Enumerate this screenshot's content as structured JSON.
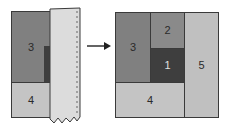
{
  "colors": {
    "block1": "#3e3e3e",
    "block2": "#8a8a8a",
    "block3": "#808080",
    "block4": "#c4c4c4",
    "block5": "#c0c0c0",
    "paper": "#dcdcdc",
    "stroke": "#3a3a3a"
  },
  "before": {
    "blocks": [
      {
        "id": "3",
        "label": "3"
      },
      {
        "id": "4",
        "label": "4"
      }
    ],
    "paper_strip": "perforated-paper-icon"
  },
  "arrow": "right-arrow-icon",
  "after": {
    "blocks": [
      {
        "id": "3",
        "label": "3"
      },
      {
        "id": "2",
        "label": "2"
      },
      {
        "id": "1",
        "label": "1"
      },
      {
        "id": "5",
        "label": "5"
      },
      {
        "id": "4",
        "label": "4"
      }
    ]
  }
}
